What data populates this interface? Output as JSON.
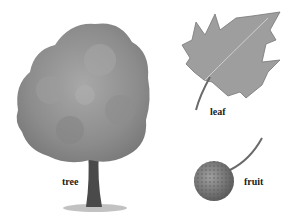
{
  "labels": {
    "tree": "tree",
    "leaf": "leaf",
    "fruit": "fruit"
  },
  "colors": {
    "foliage": "#8a8a8a",
    "trunk": "#4a4a4a",
    "leaf": "#9a9a9a",
    "fruit": "#7a7a7a"
  }
}
